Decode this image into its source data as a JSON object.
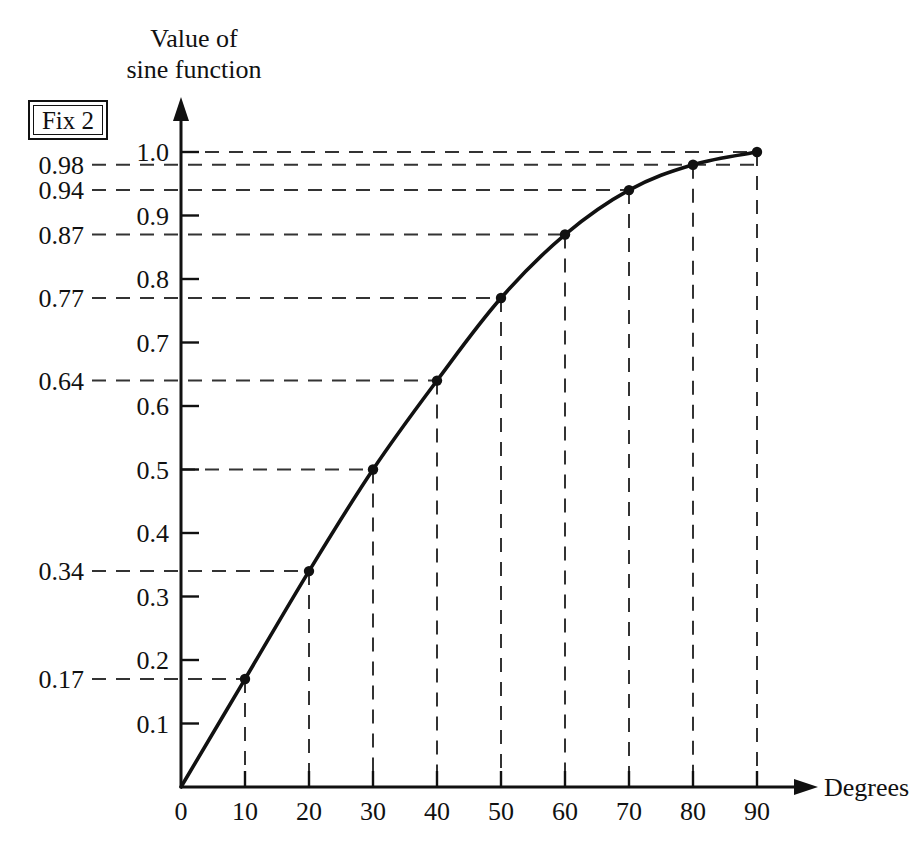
{
  "figure": {
    "title_line1": "Value of",
    "title_line2": "sine function",
    "xaxis_name": "Degrees",
    "fix_badge": "Fix 2",
    "background_color": "#ffffff",
    "ink_color": "#111111",
    "guide_color": "#333333"
  },
  "chart_data": {
    "type": "line",
    "title": "Value of sine function",
    "xlabel": "Degrees",
    "ylabel": "Value of sine function",
    "x": [
      0,
      10,
      20,
      30,
      40,
      50,
      60,
      70,
      80,
      90
    ],
    "values": [
      0,
      0.17,
      0.34,
      0.5,
      0.64,
      0.77,
      0.87,
      0.94,
      0.98,
      1.0
    ],
    "series": [
      {
        "name": "sine",
        "values": [
          0,
          0.17,
          0.34,
          0.5,
          0.64,
          0.77,
          0.87,
          0.94,
          0.98,
          1.0
        ]
      }
    ],
    "point_labels": [
      "0",
      "0.17",
      "0.34",
      "0.5",
      "0.64",
      "0.77",
      "0.87",
      "0.94",
      "0.98",
      "1.0"
    ],
    "xlim": [
      0,
      90
    ],
    "ylim": [
      0,
      1.0
    ],
    "xticks": [
      0,
      10,
      20,
      30,
      40,
      50,
      60,
      70,
      80,
      90
    ],
    "xtick_labels": [
      "0",
      "10",
      "20",
      "30",
      "40",
      "50",
      "60",
      "70",
      "80",
      "90"
    ],
    "yticks": [
      0.1,
      0.2,
      0.3,
      0.4,
      0.5,
      0.6,
      0.7,
      0.8,
      0.9,
      1.0
    ],
    "ytick_labels": [
      "0.1",
      "0.2",
      "0.3",
      "0.4",
      "0.5",
      "0.6",
      "0.7",
      "0.8",
      "0.9",
      "1.0"
    ],
    "value_annotations": [
      {
        "value": 0.17,
        "label": "0.17",
        "degrees": 10
      },
      {
        "value": 0.34,
        "label": "0.34",
        "degrees": 20
      },
      {
        "value": 0.64,
        "label": "0.64",
        "degrees": 40
      },
      {
        "value": 0.77,
        "label": "0.77",
        "degrees": 50
      },
      {
        "value": 0.87,
        "label": "0.87",
        "degrees": 60
      },
      {
        "value": 0.94,
        "label": "0.94",
        "degrees": 70
      },
      {
        "value": 0.98,
        "label": "0.98",
        "degrees": 90
      }
    ],
    "grid": false,
    "gridlines": "dashed leader lines from labelled values to curve points, and dashed drop lines from each point to the x-axis",
    "legend": null,
    "markers": "filled circles at every 10 degrees",
    "annotation_badge": "Fix 2"
  },
  "y_axis_ticks": [
    {
      "label": "1.0"
    },
    {
      "label": "0.9"
    },
    {
      "label": "0.8"
    },
    {
      "label": "0.7"
    },
    {
      "label": "0.6"
    },
    {
      "label": "0.5"
    },
    {
      "label": "0.4"
    },
    {
      "label": "0.3"
    },
    {
      "label": "0.2"
    },
    {
      "label": "0.1"
    }
  ],
  "y_value_labels": [
    {
      "label": "0.98"
    },
    {
      "label": "0.94"
    },
    {
      "label": "0.87"
    },
    {
      "label": "0.77"
    },
    {
      "label": "0.64"
    },
    {
      "label": "0.34"
    },
    {
      "label": "0.17"
    }
  ],
  "x_axis_ticks": [
    {
      "label": "0"
    },
    {
      "label": "10"
    },
    {
      "label": "20"
    },
    {
      "label": "30"
    },
    {
      "label": "40"
    },
    {
      "label": "50"
    },
    {
      "label": "60"
    },
    {
      "label": "70"
    },
    {
      "label": "80"
    },
    {
      "label": "90"
    }
  ]
}
